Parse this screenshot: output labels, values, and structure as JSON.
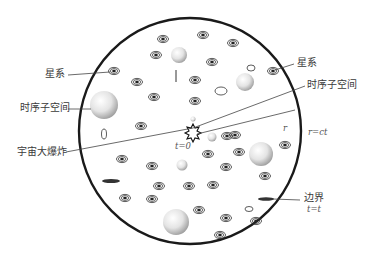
{
  "diagram": {
    "type": "universe-schematic",
    "colors": {
      "boundary": "#1a1a1a",
      "line": "#444444",
      "text": "#3a3a3a",
      "background": "#ffffff"
    },
    "labels": {
      "galaxy_left": "星系",
      "galaxy_right": "星系",
      "subspace_left": "时序子空间",
      "subspace_right": "时序子空间",
      "big_bang": "宇宙大爆炸",
      "t_zero": "t=0",
      "radius": "r",
      "radius_eq": "r=ct",
      "boundary": "边界",
      "boundary_eq": "t=t"
    }
  }
}
